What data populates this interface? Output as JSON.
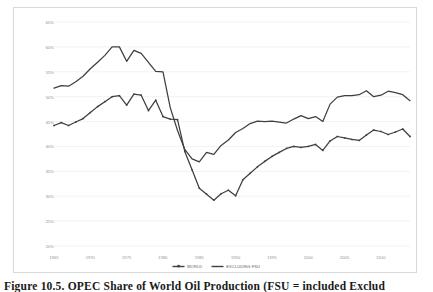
{
  "figure": {
    "caption": "Figure 10.5.  OPEC Share of World Oil Production (FSU = included Exclud"
  },
  "chart_data": {
    "type": "line",
    "title": "",
    "xlabel": "",
    "ylabel": "",
    "xlim": [
      1965,
      2014
    ],
    "ylim": [
      20,
      65
    ],
    "grid": true,
    "grid_axis": "y",
    "legend_position": "bottom-center",
    "y_tick_labels": [
      "65%",
      "60%",
      "55%",
      "50%",
      "45%",
      "40%",
      "35%",
      "30%",
      "25%",
      "20%"
    ],
    "y_tick_values": [
      65,
      60,
      55,
      50,
      45,
      40,
      35,
      30,
      25,
      20
    ],
    "x_tick_labels": [
      "1965",
      "1970",
      "1975",
      "1980",
      "1985",
      "1990",
      "1995",
      "2000",
      "2005",
      "2010"
    ],
    "x_tick_values": [
      1965,
      1970,
      1975,
      1980,
      1985,
      1990,
      1995,
      2000,
      2005,
      2010
    ],
    "colors": {
      "world": "#3f3f3f",
      "excluding_fsu": "#3f3f3f"
    },
    "x": [
      1965,
      1966,
      1967,
      1968,
      1969,
      1970,
      1971,
      1972,
      1973,
      1974,
      1975,
      1976,
      1977,
      1978,
      1979,
      1980,
      1981,
      1982,
      1983,
      1984,
      1985,
      1986,
      1987,
      1988,
      1989,
      1990,
      1991,
      1992,
      1993,
      1994,
      1995,
      1996,
      1997,
      1998,
      1999,
      2000,
      2001,
      2002,
      2003,
      2004,
      2005,
      2006,
      2007,
      2008,
      2009,
      2010,
      2011,
      2012,
      2013,
      2014
    ],
    "series": [
      {
        "name": "WORLD",
        "marker": "small-square",
        "values": [
          44.2,
          44.8,
          44.2,
          44.9,
          45.6,
          46.8,
          48.0,
          49.0,
          50.0,
          50.2,
          48.3,
          50.5,
          50.3,
          47.2,
          49.3,
          46.0,
          45.5,
          45.4,
          39.0,
          35.3,
          31.6,
          30.4,
          29.2,
          30.5,
          31.2,
          30.1,
          33.3,
          34.6,
          35.9,
          37.0,
          38.0,
          38.8,
          39.6,
          40.0,
          39.8,
          40.0,
          40.4,
          39.2,
          41.1,
          42.0,
          41.7,
          41.4,
          41.2,
          42.3,
          43.3,
          43.0,
          42.4,
          42.9,
          43.5,
          42.0
        ]
      },
      {
        "name": "EXCLUDING FSU",
        "marker": "none",
        "values": [
          51.7,
          52.2,
          52.1,
          53.0,
          54.1,
          55.6,
          56.9,
          58.3,
          60.0,
          60.0,
          57.1,
          59.3,
          58.7,
          56.9,
          55.1,
          55.0,
          47.8,
          43.2,
          39.4,
          37.5,
          36.9,
          38.8,
          38.4,
          40.2,
          41.3,
          42.8,
          43.6,
          44.6,
          45.1,
          45.0,
          45.1,
          44.9,
          44.7,
          45.5,
          46.2,
          45.6,
          46.0,
          45.0,
          48.5,
          49.9,
          50.2,
          50.2,
          50.4,
          51.2,
          50.0,
          50.3,
          51.1,
          50.8,
          50.4,
          49.2
        ]
      }
    ]
  }
}
